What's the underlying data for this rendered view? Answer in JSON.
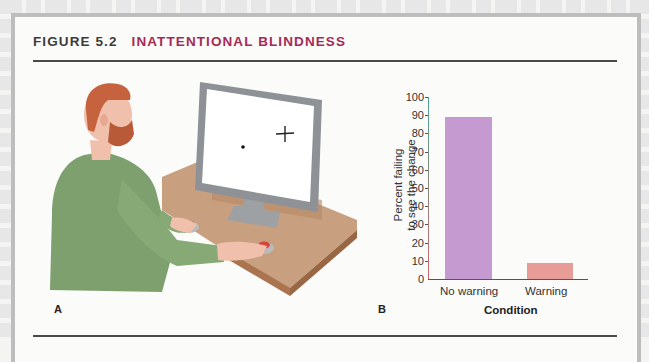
{
  "figure": {
    "number": "FIGURE 5.2",
    "title": "INATTENTIONAL BLINDNESS",
    "title_color": "#a52a57",
    "panel_a_label": "A",
    "panel_b_label": "B",
    "illustration": {
      "description": "Bearded man in green sweater seated at a desk, hands on two red response buttons, looking at a monitor displaying a fixation dot and a cross",
      "screen_items": [
        "fixation-dot",
        "cross"
      ]
    }
  },
  "chart_data": {
    "type": "bar",
    "title": "",
    "categories": [
      "No warning",
      "Warning"
    ],
    "values": [
      89,
      9
    ],
    "colors": [
      "#c59ad0",
      "#e79c98"
    ],
    "xlabel": "Condition",
    "ylabel_line1": "Percent failing",
    "ylabel_line2": "to see the change",
    "ylabel": "Percent failing to see the change",
    "ylim": [
      0,
      100
    ],
    "yticks": [
      100,
      90,
      80,
      70,
      60,
      50,
      40,
      30,
      20,
      10,
      0
    ],
    "grid": false,
    "legend": "none"
  }
}
